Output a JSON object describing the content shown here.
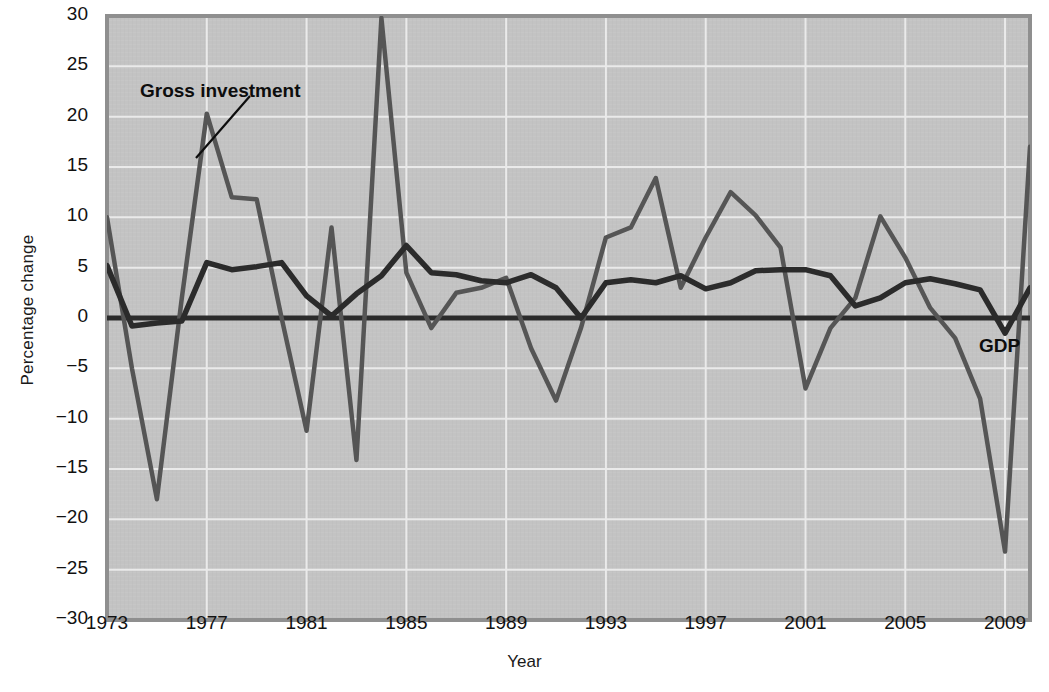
{
  "chart_data": {
    "type": "line",
    "title": "",
    "xlabel": "Year",
    "ylabel": "Percentage change",
    "xlim": [
      1973,
      2010
    ],
    "ylim": [
      -30,
      30
    ],
    "grid": true,
    "legend_position": "inline-annotations",
    "xticks": [
      "1973",
      "1977",
      "1981",
      "1985",
      "1989",
      "1993",
      "1997",
      "2001",
      "2005",
      "2009"
    ],
    "xtick_values": [
      1973,
      1977,
      1981,
      1985,
      1989,
      1993,
      1997,
      2001,
      2005,
      2009
    ],
    "yticks": [
      "30",
      "25",
      "20",
      "15",
      "10",
      "5",
      "0",
      "−5",
      "−10",
      "−15",
      "−20",
      "−25",
      "−30"
    ],
    "ytick_values": [
      30,
      25,
      20,
      15,
      10,
      5,
      0,
      -5,
      -10,
      -15,
      -20,
      -25,
      -30
    ],
    "x": [
      1973,
      1974,
      1975,
      1976,
      1977,
      1978,
      1979,
      1980,
      1981,
      1982,
      1983,
      1984,
      1985,
      1986,
      1987,
      1988,
      1989,
      1990,
      1991,
      1992,
      1993,
      1994,
      1995,
      1996,
      1997,
      1998,
      1999,
      2000,
      2001,
      2002,
      2003,
      2004,
      2005,
      2006,
      2007,
      2008,
      2009,
      2010
    ],
    "series": [
      {
        "name": "Gross investment",
        "label": "Gross investment",
        "color": "#555555",
        "values": [
          10.0,
          -5.0,
          -18.0,
          2.0,
          20.3,
          12.0,
          11.8,
          0.0,
          -11.2,
          9.0,
          -14.1,
          29.8,
          4.5,
          -1.0,
          2.5,
          3.0,
          4.0,
          -3.0,
          -8.2,
          -1.0,
          8.0,
          9.0,
          13.9,
          3.0,
          8.0,
          12.5,
          10.2,
          7.0,
          -7.0,
          -1.0,
          2.0,
          10.1,
          6.0,
          1.0,
          -2.0,
          -8.0,
          -23.2,
          17.0
        ]
      },
      {
        "name": "GDP",
        "label": "GDP",
        "color": "#2b2b2b",
        "values": [
          5.2,
          -0.8,
          -0.5,
          -0.3,
          5.5,
          4.8,
          5.1,
          5.5,
          2.2,
          0.2,
          2.4,
          4.2,
          7.2,
          4.5,
          4.3,
          3.7,
          3.5,
          4.3,
          3.0,
          0.0,
          3.5,
          3.8,
          3.5,
          4.2,
          2.9,
          3.5,
          4.7,
          4.8,
          4.8,
          4.2,
          1.2,
          2.0,
          3.5,
          3.9,
          3.4,
          2.8,
          -1.5,
          3.0
        ]
      }
    ],
    "annotations": [
      {
        "name": "gross-investment-annotation",
        "text": "Gross investment",
        "x_px": 140,
        "y_px": 80,
        "leader_from": [
          250,
          96
        ],
        "leader_to": [
          196,
          158
        ]
      },
      {
        "name": "gdp-annotation",
        "text": "GDP",
        "x_px": 979,
        "y_px": 335,
        "leader_from": null,
        "leader_to": null
      }
    ],
    "colors": {
      "plot_background": "#c3c3c3",
      "grid": "#eaeaea",
      "zero_line": "#2b2b2b",
      "border": "#8f8f8f",
      "page_background": "#ffffff",
      "text": "#111111"
    }
  }
}
